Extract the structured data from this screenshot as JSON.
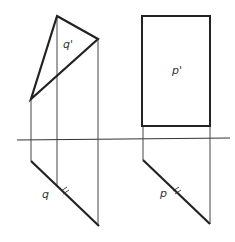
{
  "diagram": {
    "type": "orthographic-projection",
    "colors": {
      "line": "#222222",
      "thin_line": "#444444",
      "background": "#ffffff"
    },
    "axis": {
      "x1": 17,
      "y1": 140,
      "x2": 230,
      "y2": 138
    },
    "plane_q": {
      "frontal_label": "q'",
      "horizontal_label": "q",
      "frontal_triangle": [
        [
          57,
          16
        ],
        [
          98,
          39
        ],
        [
          31,
          99
        ]
      ],
      "projection_lines": [
        {
          "x": 31,
          "y_top": 99,
          "y_bottom": 161
        },
        {
          "x": 57,
          "y_top": 16,
          "y_bottom": 186
        },
        {
          "x": 98,
          "y_top": 39,
          "y_bottom": 226
        }
      ],
      "horizontal_trace": [
        [
          31,
          140
        ],
        [
          31,
          161
        ],
        [
          99,
          226
        ]
      ],
      "parallel_mark": "double-tick"
    },
    "plane_p": {
      "frontal_label": "p'",
      "horizontal_label": "p",
      "frontal_rectangle": {
        "x": 142,
        "y": 16,
        "width": 68,
        "height": 110
      },
      "projection_lines": [
        {
          "x": 143,
          "y_top": 126,
          "y_bottom": 160
        },
        {
          "x": 210,
          "y_top": 126,
          "y_bottom": 224
        }
      ],
      "horizontal_trace": [
        [
          143,
          139
        ],
        [
          143,
          160
        ],
        [
          210,
          224
        ]
      ],
      "parallel_mark": "double-tick"
    }
  }
}
